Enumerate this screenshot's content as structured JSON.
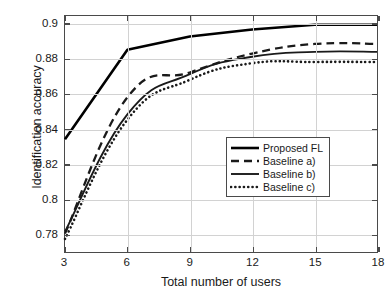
{
  "chart_data": {
    "type": "line",
    "title": "",
    "xlabel": "Total number of users",
    "ylabel": "Identification accuracy",
    "x": [
      3,
      6,
      9,
      12,
      15,
      18
    ],
    "xticks": [
      "3",
      "6",
      "9",
      "12",
      "15",
      "18"
    ],
    "yticks": [
      "0.78",
      "0.8",
      "0.82",
      "0.84",
      "0.86",
      "0.88",
      "0.9"
    ],
    "ytick_values": [
      0.78,
      0.8,
      0.82,
      0.84,
      0.86,
      0.88,
      0.9
    ],
    "xlim": [
      3,
      18
    ],
    "ylim": [
      0.7695,
      0.9045
    ],
    "grid": true,
    "legend_position": "center-right",
    "series": [
      {
        "name": "Proposed FL",
        "style": "solid-thick",
        "color": "#000000",
        "values": [
          0.834,
          0.8852,
          0.8928,
          0.8968,
          0.8995,
          0.8995
        ]
      },
      {
        "name": "Baseline a)",
        "style": "dashed",
        "color": "#1a1a1a",
        "values": [
          0.78,
          0.858,
          0.8722,
          0.883,
          0.8885,
          0.8885
        ]
      },
      {
        "name": "Baseline b)",
        "style": "solid",
        "color": "#1a1a1a",
        "values": [
          0.7812,
          0.8482,
          0.8712,
          0.8812,
          0.884,
          0.884
        ]
      },
      {
        "name": "Baseline c)",
        "style": "dotted",
        "color": "#1a1a1a",
        "values": [
          0.777,
          0.8452,
          0.868,
          0.8775,
          0.8782,
          0.8782
        ]
      }
    ]
  },
  "legend": {
    "items": [
      {
        "label": "Proposed FL"
      },
      {
        "label": "Baseline a)"
      },
      {
        "label": "Baseline b)"
      },
      {
        "label": "Baseline c)"
      }
    ]
  }
}
